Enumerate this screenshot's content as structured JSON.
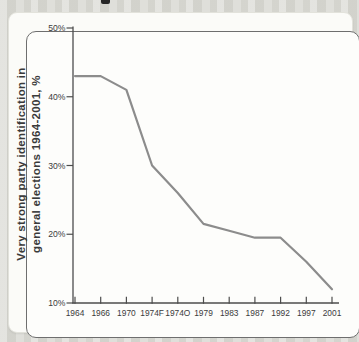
{
  "page": {
    "cropped_text_fragment": "partial dark mark of cropped text above chart"
  },
  "chart_data": {
    "type": "line",
    "title": "",
    "ylabel_line1": "Very strong party identification in",
    "ylabel_line2": "general elections 1964-2001, %",
    "categories": [
      "1964",
      "1966",
      "1970",
      "1974F",
      "1974O",
      "1979",
      "1983",
      "1987",
      "1992",
      "1997",
      "2001"
    ],
    "values": [
      43,
      43,
      41,
      30,
      26,
      21.5,
      20.5,
      19.5,
      19.5,
      16,
      12
    ],
    "series_name": "Very strong party identification (%)",
    "y_tick_labels": [
      "50%",
      "40%",
      "30%",
      "20%",
      "10%"
    ],
    "y_tick_values": [
      50,
      40,
      30,
      20,
      10
    ],
    "ylim": [
      10,
      50
    ],
    "grid": false,
    "legend": false,
    "line_color": "#8c8c8c",
    "axis_color": "#4d4d4d",
    "label_color": "#3b3b3b"
  }
}
